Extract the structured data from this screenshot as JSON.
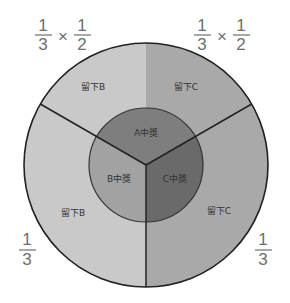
{
  "diagram": {
    "title": "",
    "colors": {
      "outer_left": "#c9c9c9",
      "outer_right": "#a9a9a9",
      "outer_top_left": "#c9c9c9",
      "outer_top_right": "#a9a9a9",
      "inner_top": "#7e7e7e",
      "inner_left": "#a2a2a2",
      "inner_right": "#6a6a6a",
      "stroke": "#222222",
      "fraction_text": "#6e6e6e"
    },
    "outer_labels": {
      "top_left": "留下B",
      "top_right": "留下C",
      "bottom_left": "留下B",
      "bottom_right": "留下C"
    },
    "inner_labels": {
      "top": "A中獎",
      "left": "B中獎",
      "right": "C中獎"
    },
    "fractions": {
      "top_left": {
        "a_num": "1",
        "a_den": "3",
        "op": "×",
        "b_num": "1",
        "b_den": "2"
      },
      "top_right": {
        "a_num": "1",
        "a_den": "3",
        "op": "×",
        "b_num": "1",
        "b_den": "2"
      },
      "bottom_left": {
        "num": "1",
        "den": "3"
      },
      "bottom_right": {
        "num": "1",
        "den": "3"
      }
    }
  }
}
